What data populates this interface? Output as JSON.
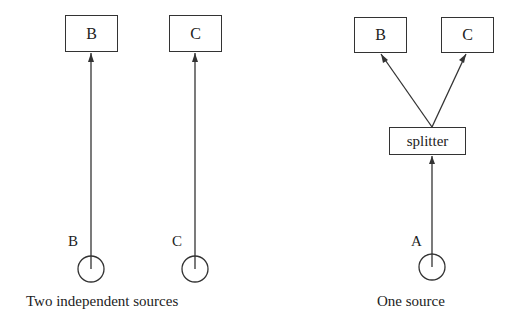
{
  "diagram": {
    "left": {
      "caption": "Two independent sources",
      "boxes": [
        "B",
        "C"
      ],
      "sources": [
        "B",
        "C"
      ]
    },
    "right": {
      "caption": "One source",
      "boxes": [
        "B",
        "C"
      ],
      "splitter": "splitter",
      "source": "A"
    }
  }
}
